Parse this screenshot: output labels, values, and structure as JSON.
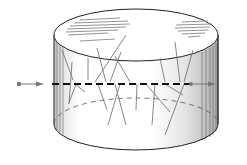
{
  "figure": {
    "colors": {
      "outline": "#222222",
      "fiber": "#777777",
      "track": "#111111",
      "arrow": "#777777",
      "hatch": "#888888",
      "background": "#ffffff"
    },
    "cylinder": {
      "cx": 136,
      "top_cy": 35,
      "bottom_cy": 124,
      "rx": 82,
      "ry": 26
    },
    "track": {
      "y": 84,
      "x_start": 18,
      "x_end": 215
    },
    "fibers": [
      [
        62,
        50,
        73,
        80
      ],
      [
        72,
        62,
        69,
        104
      ],
      [
        88,
        58,
        88,
        80
      ],
      [
        97,
        48,
        106,
        82
      ],
      [
        126,
        35,
        95,
        82
      ],
      [
        121,
        52,
        110,
        82
      ],
      [
        115,
        56,
        130,
        82
      ],
      [
        160,
        58,
        165,
        82
      ],
      [
        175,
        42,
        180,
        82
      ],
      [
        193,
        50,
        184,
        82
      ],
      [
        76,
        84,
        69,
        103
      ],
      [
        98,
        84,
        107,
        110
      ],
      [
        120,
        84,
        108,
        125
      ],
      [
        115,
        84,
        126,
        125
      ],
      [
        137,
        84,
        136,
        110
      ],
      [
        146,
        84,
        170,
        112
      ],
      [
        165,
        84,
        183,
        95
      ],
      [
        184,
        84,
        165,
        135
      ],
      [
        155,
        84,
        152,
        125
      ],
      [
        75,
        84,
        85,
        92
      ]
    ]
  }
}
